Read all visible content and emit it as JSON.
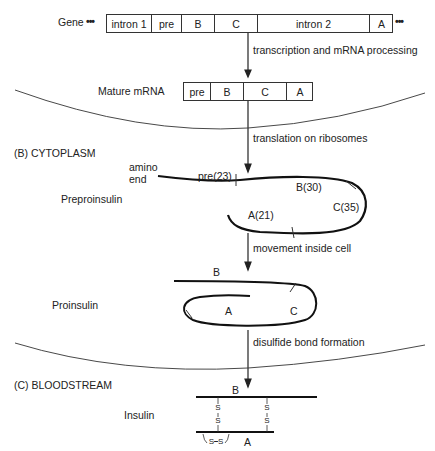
{
  "sections": {
    "b_label": "(B)   CYTOPLASM",
    "c_label": "(C)   BLOODSTREAM"
  },
  "gene": {
    "label": "Gene",
    "ellipsis_left": "•••",
    "ellipsis_right": "•••",
    "segments": [
      "intron 1",
      "pre",
      "B",
      "C",
      "intron 2",
      "A"
    ]
  },
  "mrna": {
    "label": "Mature mRNA",
    "segments": [
      "pre",
      "B",
      "C",
      "A"
    ]
  },
  "steps": {
    "transcription": "transcription and mRNA processing",
    "translation": "translation on ribosomes",
    "movement": "movement inside cell",
    "disulfide": "disulfide bond formation"
  },
  "preproinsulin": {
    "label": "Preproinsulin",
    "amino": "amino",
    "end": "end",
    "pre": "pre(23)",
    "b": "B(30)",
    "c": "C(35)",
    "a": "A(21)"
  },
  "proinsulin": {
    "label": "Proinsulin",
    "b": "B",
    "a": "A",
    "c": "C"
  },
  "insulin": {
    "label": "Insulin",
    "b": "B",
    "a": "A",
    "s": "S",
    "intra_bond": "S⎯S"
  }
}
